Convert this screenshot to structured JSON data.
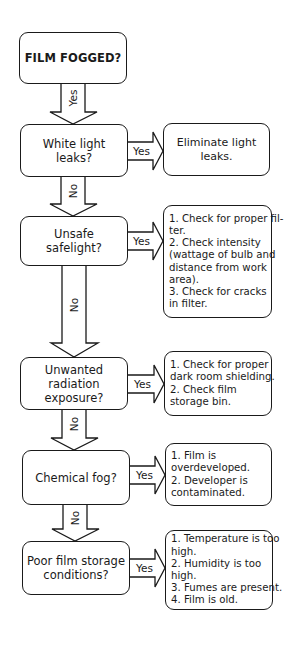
{
  "flowchart": {
    "title": "FILM FOGGED?",
    "start": {
      "label": "FILM FOGGED?"
    },
    "steps": [
      {
        "question": "White light leaks?",
        "yes_label": "Yes",
        "action_lines": [
          "Eliminate light",
          "leaks."
        ],
        "incoming_label": "Yes"
      },
      {
        "question": "Unsafe safelight?",
        "yes_label": "Yes",
        "action_lines": [
          "1. Check for proper fil-",
          "ter.",
          "2. Check intensity",
          "(wattage of bulb and",
          "distance from work",
          "area).",
          "3. Check for cracks",
          "in filter."
        ],
        "incoming_label": "No"
      },
      {
        "question_lines": [
          "Unwanted radiation",
          "exposure?"
        ],
        "yes_label": "Yes",
        "action_lines": [
          "1. Check for proper",
          "dark room shielding.",
          "2. Check film",
          "storage bin."
        ],
        "incoming_label": "No"
      },
      {
        "question": "Chemical fog?",
        "yes_label": "Yes",
        "action_lines": [
          "1. Film is",
          "overdeveloped.",
          "2. Developer is",
          "contaminated."
        ],
        "incoming_label": "No"
      },
      {
        "question_lines": [
          "Poor film storage",
          "conditions?"
        ],
        "yes_label": "Yes",
        "action_lines": [
          "1. Temperature is too",
          "high.",
          "2. Humidity is too",
          "high.",
          "3. Fumes are present.",
          "4. Film is old."
        ],
        "incoming_label": "No"
      }
    ]
  },
  "colors": {
    "stroke": "#1a1a1a",
    "background": "#ffffff"
  }
}
